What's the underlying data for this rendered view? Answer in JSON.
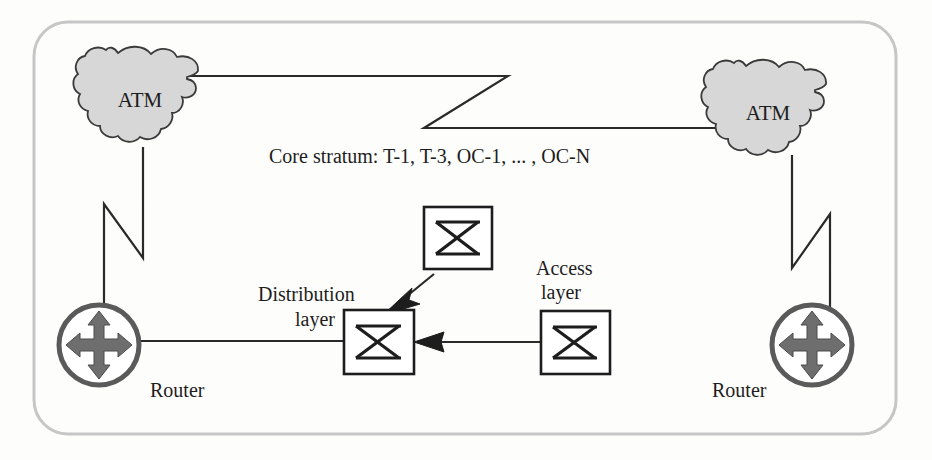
{
  "diagram": {
    "frame": {
      "name": "rounded-rectangle-border",
      "color": "#c6c6c6"
    },
    "clouds": [
      {
        "id": "atm-left",
        "label": "ATM",
        "x": 140,
        "y": 100
      },
      {
        "id": "atm-right",
        "label": "ATM",
        "x": 768,
        "y": 113
      }
    ],
    "routers": [
      {
        "id": "router-left",
        "label": "Router",
        "cx": 99,
        "cy": 345,
        "label_x": 150,
        "label_y": 397
      },
      {
        "id": "router-right",
        "label": "Router",
        "cx": 812,
        "cy": 345,
        "label_x": 712,
        "label_y": 397
      }
    ],
    "switches": [
      {
        "id": "switch-access-top",
        "x": 424,
        "y": 207,
        "w": 68,
        "h": 62
      },
      {
        "id": "switch-distribution",
        "x": 344,
        "y": 310,
        "w": 70,
        "h": 64
      },
      {
        "id": "switch-access-right",
        "x": 541,
        "y": 311,
        "w": 69,
        "h": 63
      }
    ],
    "labels": {
      "core_stratum": "Core stratum: T-1, T-3, OC-1, ... ,  OC-N",
      "distribution_layer_line1": "Distribution",
      "distribution_layer_line2": "layer",
      "access_layer_line1": "Access",
      "access_layer_line2": "layer",
      "atm": "ATM",
      "router": "Router"
    },
    "links": [
      {
        "id": "link-top-core",
        "from": "atm-left",
        "to": "atm-right",
        "style": "zigzag-horizontal"
      },
      {
        "id": "link-left-vertical",
        "from": "atm-left",
        "to": "router-left",
        "style": "zigzag-vertical"
      },
      {
        "id": "link-right-vertical",
        "from": "atm-right",
        "to": "router-right",
        "style": "zigzag-vertical"
      },
      {
        "id": "link-router-to-distribution",
        "from": "router-left",
        "to": "switch-distribution",
        "style": "straight"
      },
      {
        "id": "link-access-top-to-distribution",
        "from": "switch-access-top",
        "to": "switch-distribution",
        "style": "arrow"
      },
      {
        "id": "link-access-right-to-distribution",
        "from": "switch-access-right",
        "to": "switch-distribution",
        "style": "arrow"
      }
    ],
    "colors": {
      "cloud_fill": "#d7d7d7",
      "cloud_stroke": "#3a3a3a",
      "line": "#2a2a2a",
      "router_fill": "#6e6e6e",
      "router_ring": "#5a5a5a",
      "text": "#1d1d1d",
      "frame": "#c6c6c6",
      "background": "#fdfdfc"
    }
  }
}
